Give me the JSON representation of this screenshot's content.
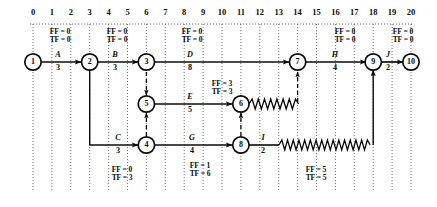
{
  "diagram": {
    "type": "cpm-time-scaled-network",
    "colors": {
      "ink": "#0b0b0b",
      "paper": "#ffffff",
      "grid": "#4d4d4d"
    },
    "axis": {
      "label": "time",
      "ticks": [
        "0",
        "1",
        "2",
        "3",
        "4",
        "5",
        "6",
        "7",
        "8",
        "9",
        "10",
        "11",
        "12",
        "13",
        "14",
        "15",
        "16",
        "17",
        "18",
        "19",
        "20"
      ],
      "min": 0,
      "max": 20,
      "grid": "dotted-vertical"
    },
    "nodes": [
      {
        "id": "1",
        "label": "1",
        "time": 0,
        "row": "top"
      },
      {
        "id": "2",
        "label": "2",
        "time": 3,
        "row": "top"
      },
      {
        "id": "3",
        "label": "3",
        "time": 6,
        "row": "top"
      },
      {
        "id": "7",
        "label": "7",
        "time": 14,
        "row": "top"
      },
      {
        "id": "9",
        "label": "9",
        "time": 18,
        "row": "top"
      },
      {
        "id": "10",
        "label": "10",
        "time": 20,
        "row": "top"
      },
      {
        "id": "5",
        "label": "5",
        "time": 6,
        "row": "middle"
      },
      {
        "id": "6",
        "label": "6",
        "time": 11,
        "row": "middle"
      },
      {
        "id": "4",
        "label": "4",
        "time": 6,
        "row": "bottom"
      },
      {
        "id": "8",
        "label": "8",
        "time": 11,
        "row": "bottom"
      }
    ],
    "activities": [
      {
        "name": "A",
        "duration": "3",
        "from": "1",
        "to": "2",
        "start": 0,
        "finish": 3,
        "row": "top",
        "float_bar": null
      },
      {
        "name": "B",
        "duration": "3",
        "from": "2",
        "to": "3",
        "start": 3,
        "finish": 6,
        "row": "top",
        "float_bar": null
      },
      {
        "name": "D",
        "duration": "8",
        "from": "3",
        "to": "7",
        "start": 6,
        "finish": 14,
        "row": "top",
        "float_bar": null
      },
      {
        "name": "H",
        "duration": "4",
        "from": "7",
        "to": "9",
        "start": 14,
        "finish": 18,
        "row": "top",
        "float_bar": null
      },
      {
        "name": "J",
        "duration": "2",
        "from": "9",
        "to": "10",
        "start": 18,
        "finish": 20,
        "row": "top",
        "float_bar": null
      },
      {
        "name": "E",
        "duration": "5",
        "from": "5",
        "to": "6",
        "start": 6,
        "finish": 11,
        "row": "middle",
        "float_bar": {
          "from": 11,
          "to": 14
        }
      },
      {
        "name": "C",
        "duration": "3",
        "from": "2",
        "to": "4",
        "start": 3,
        "finish": 6,
        "row": "bottom",
        "float_bar": null
      },
      {
        "name": "G",
        "duration": "4",
        "from": "4",
        "to": "8",
        "start": 6,
        "finish": 11,
        "row": "bottom",
        "float_bar": null
      },
      {
        "name": "I",
        "duration": "2",
        "from": "8",
        "to": "9",
        "start": 11,
        "finish": 13,
        "row": "bottom",
        "float_bar": {
          "from": 13,
          "to": 18
        }
      }
    ],
    "dummies": [
      {
        "from": "3",
        "to": "5",
        "style": "dashed-vertical-down"
      },
      {
        "from": "4",
        "to": "5",
        "style": "dashed-vertical-up"
      },
      {
        "from": "8",
        "to": "6",
        "style": "dashed-vertical-up"
      },
      {
        "from": "6",
        "to": "7",
        "style": "dashed-vertical-up"
      }
    ],
    "float_labels": [
      {
        "activity": "A",
        "ff": "FF = 0",
        "tf": "TF = 0",
        "position": "above",
        "time": 1.5
      },
      {
        "activity": "B",
        "ff": "FF = 0",
        "tf": "TF = 0",
        "position": "above",
        "time": 4.5
      },
      {
        "activity": "D",
        "ff": "FF = 0",
        "tf": "TF = 0",
        "position": "above",
        "time": 8.5
      },
      {
        "activity": "H",
        "ff": "FF = 0",
        "tf": "TF = 0",
        "position": "above",
        "time": 16.5
      },
      {
        "activity": "J",
        "ff": "FF = 0",
        "tf": "TF = 0",
        "position": "above",
        "time": 19.5
      },
      {
        "activity": "E",
        "ff": "FF = 3",
        "tf": "TF = 3",
        "position": "above",
        "time": 10.0
      },
      {
        "activity": "C",
        "ff": "FF = 0",
        "tf": "TF = 3",
        "position": "below",
        "time": 4.7
      },
      {
        "activity": "G",
        "ff": "FF = 1",
        "tf": "TF = 6",
        "position": "below",
        "time": 8.9
      },
      {
        "activity": "I",
        "ff": "FF = 5",
        "tf": "TF = 5",
        "position": "below",
        "time": 15.0
      }
    ]
  }
}
